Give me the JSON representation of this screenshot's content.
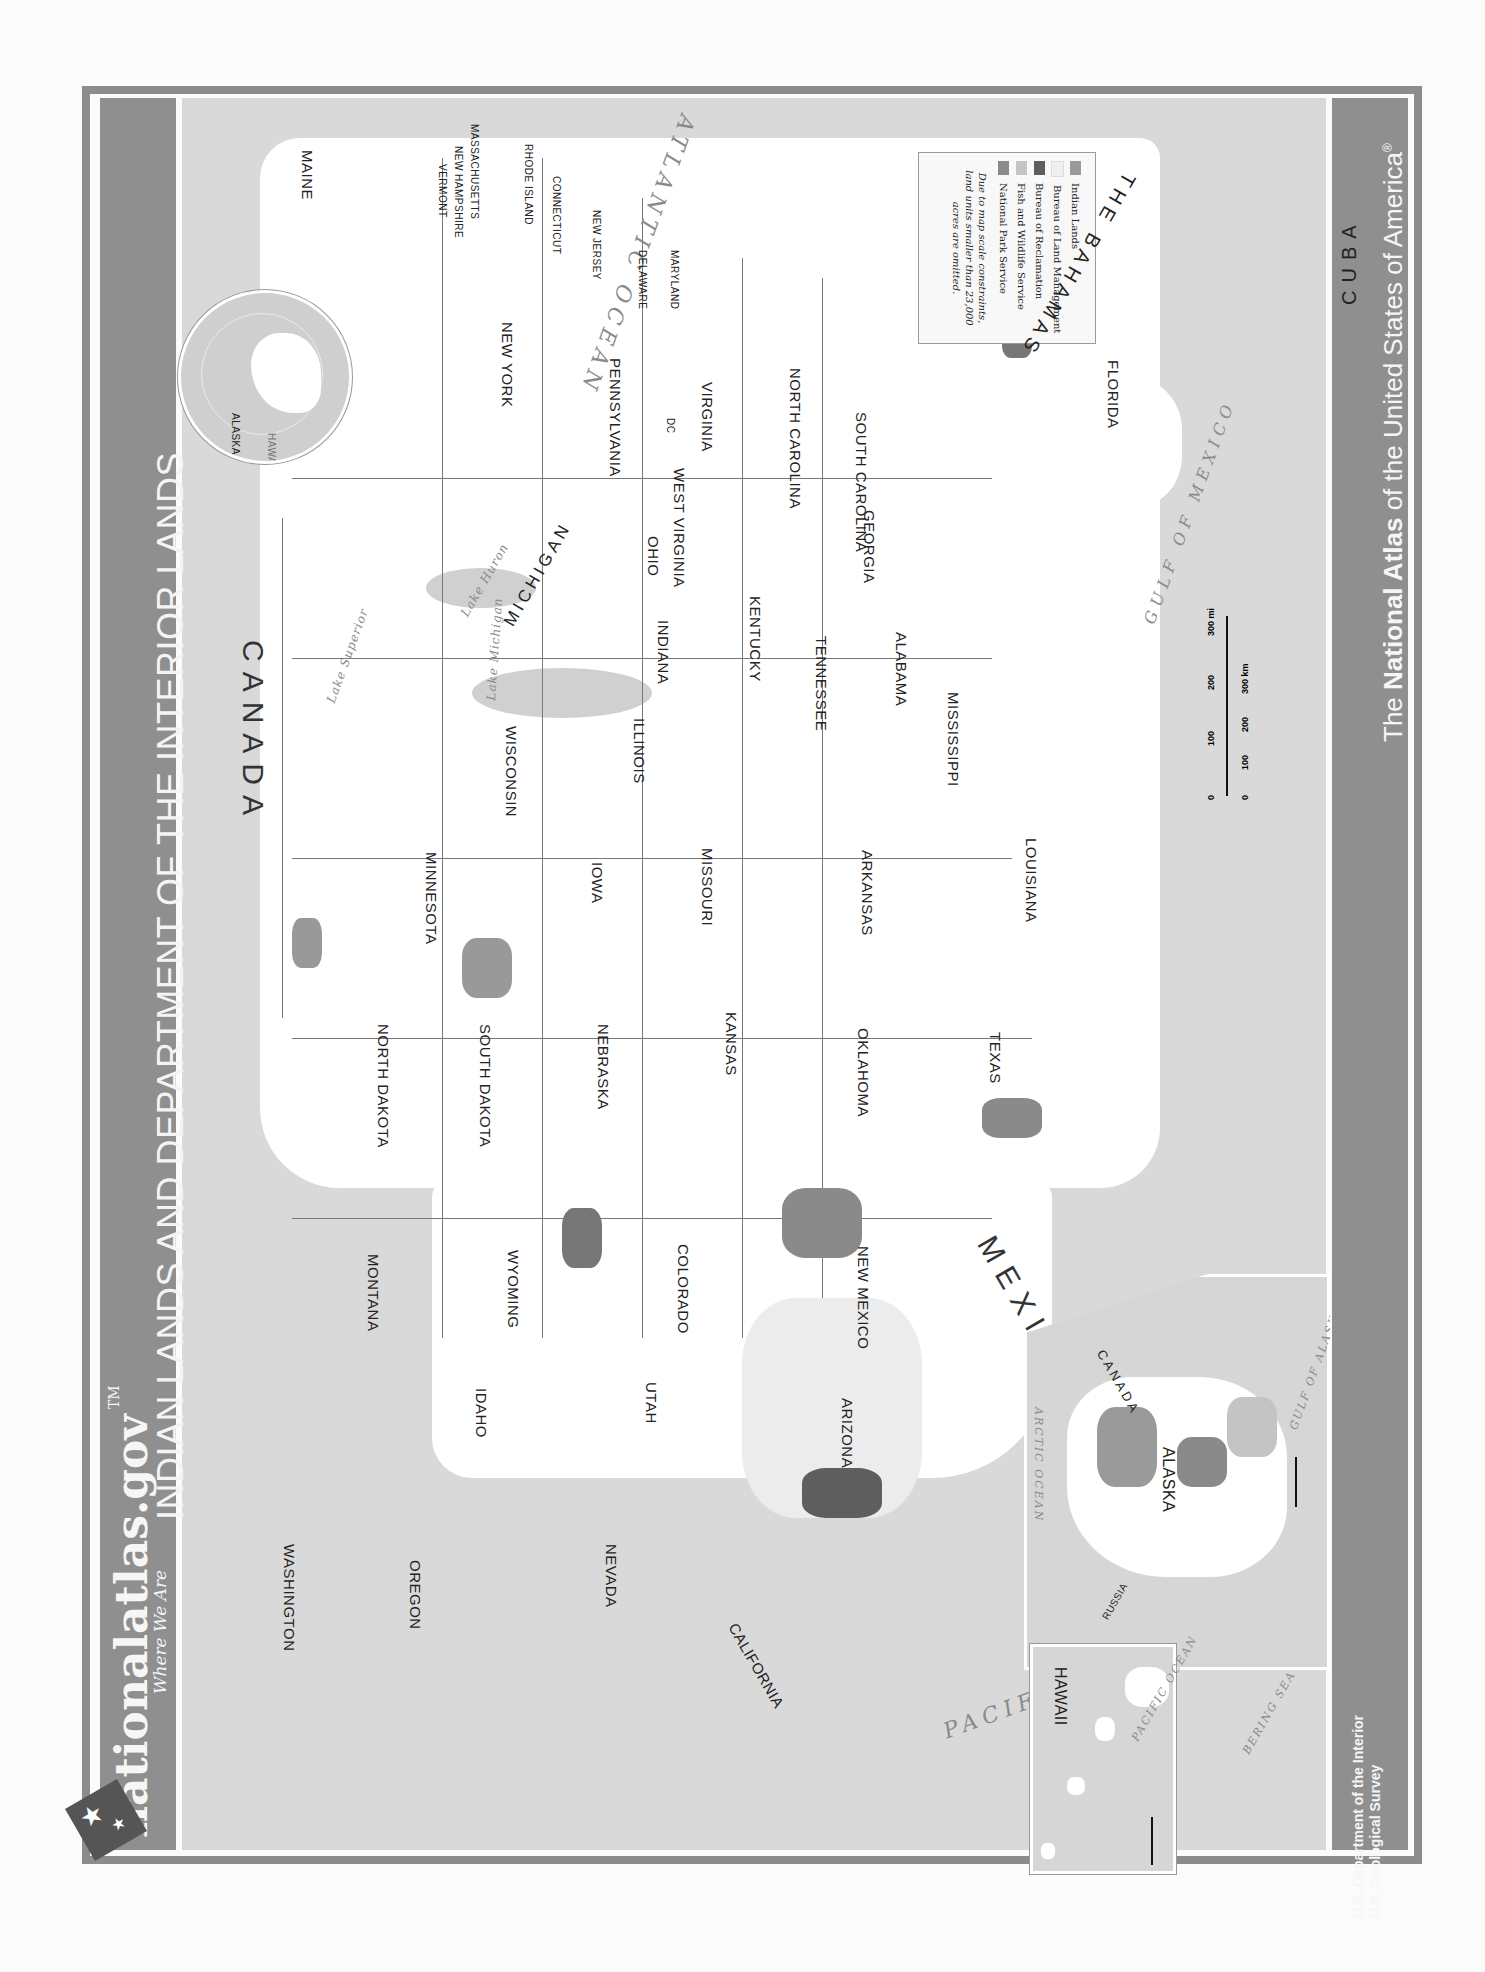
{
  "header": {
    "title": "INDIAN LANDS AND DEPARTMENT OF THE INTERIOR LANDS",
    "logo_text": "nationalatlas.gov",
    "logo_tm": "TM",
    "tagline": "Where We Are"
  },
  "footer": {
    "credits": [
      "U.S. Department of the Interior",
      "U.S. Geological Survey"
    ],
    "atlas_prefix": "The ",
    "atlas_bold": "National Atlas",
    "atlas_suffix": " of the United States of America",
    "atlas_mark": "®"
  },
  "legend": {
    "items": [
      {
        "label": "Indian Lands",
        "color": "#9a9a9a"
      },
      {
        "label": "Bureau of Land Management",
        "color": "#efefef"
      },
      {
        "label": "Bureau of Reclamation",
        "color": "#5e5e5e"
      },
      {
        "label": "Fish and Wildlife Service",
        "color": "#c4c4c4"
      },
      {
        "label": "National Park Service",
        "color": "#8a8a8a"
      }
    ],
    "note": "Due to map scale constraints, land units smaller than 23,000 acres are omitted."
  },
  "map": {
    "countries": [
      "CANADA",
      "MEXICO",
      "THE BAHAMAS",
      "CUBA"
    ],
    "oceans": [
      "ATLANTIC OCEAN",
      "PACIFIC OCEAN",
      "GULF OF MEXICO"
    ],
    "lakes": [
      "Lake Superior",
      "Lake Michigan",
      "Lake Huron"
    ],
    "states": [
      "MAINE",
      "VERMONT",
      "NEW HAMPSHIRE",
      "MASSACHUSETTS",
      "RHODE ISLAND",
      "CONNECTICUT",
      "NEW JERSEY",
      "DELAWARE",
      "MARYLAND",
      "NEW YORK",
      "PENNSYLVANIA",
      "WEST VIRGINIA",
      "VIRGINIA",
      "DC",
      "NORTH CAROLINA",
      "SOUTH CAROLINA",
      "GEORGIA",
      "FLORIDA",
      "OHIO",
      "MICHIGAN",
      "INDIANA",
      "KENTUCKY",
      "TENNESSEE",
      "ALABAMA",
      "MISSISSIPPI",
      "ILLINOIS",
      "WISCONSIN",
      "MINNESOTA",
      "IOWA",
      "MISSOURI",
      "ARKANSAS",
      "LOUISIANA",
      "NORTH DAKOTA",
      "SOUTH DAKOTA",
      "NEBRASKA",
      "KANSAS",
      "OKLAHOMA",
      "TEXAS",
      "MONTANA",
      "WYOMING",
      "COLORADO",
      "NEW MEXICO",
      "IDAHO",
      "UTAH",
      "ARIZONA",
      "WASHINGTON",
      "OREGON",
      "NEVADA",
      "CALIFORNIA"
    ],
    "scale": {
      "miles": [
        "0",
        "100",
        "200",
        "300 mi"
      ],
      "km": [
        "0",
        "100",
        "200",
        "300 km"
      ]
    }
  },
  "globe": {
    "labels": [
      "ATLANTIC OCEAN",
      "ALASKA",
      "HAWAII",
      "PACIFIC OCEAN"
    ]
  },
  "alaska_inset": {
    "label": "ALASKA",
    "neighbors": [
      "CANADA",
      "RUSSIA"
    ],
    "waters": [
      "ARCTIC OCEAN",
      "GULF OF ALASKA",
      "BERING SEA",
      "PACIFIC OCEAN"
    ],
    "scale": {
      "miles": [
        "0",
        "200 mi"
      ],
      "km": [
        "0",
        "200 km"
      ]
    }
  },
  "hawaii_inset": {
    "label": "HAWAII",
    "water": "PACIFIC OCEAN",
    "scale": {
      "miles": [
        "0",
        "100 mi"
      ],
      "km": [
        "0",
        "100 km"
      ]
    }
  }
}
